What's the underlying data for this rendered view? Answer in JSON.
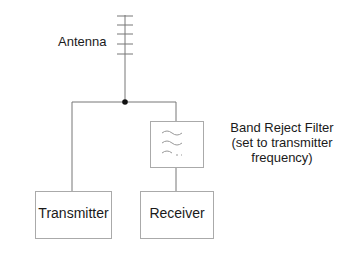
{
  "diagram": {
    "antenna": {
      "label": "Antenna"
    },
    "filter": {
      "label_lines": [
        "Band Reject Filter",
        "(set to transmitter",
        "frequency)"
      ],
      "icon": "filter-waves-icon"
    },
    "transmitter": {
      "label": "Transmitter"
    },
    "receiver": {
      "label": "Receiver"
    },
    "colors": {
      "line": "#666666",
      "box": "#999999",
      "text": "#1a1a1a",
      "node": "#111111"
    }
  }
}
